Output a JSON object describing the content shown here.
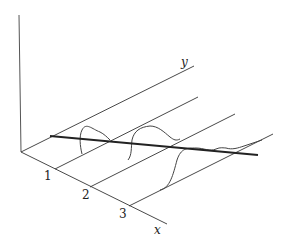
{
  "diagram": {
    "axes": {
      "x_label": "x",
      "y_label": "y",
      "tick_labels": [
        "1",
        "2",
        "3"
      ]
    },
    "elements": [
      "vertical axis",
      "y axis (receding diagonal)",
      "x axis (diagonal down-right) with ticks 1, 2, 3",
      "three parallel lines from ticks 1, 2, 3 parallel to y axis",
      "wavy curves drawn on each parallel line",
      "thick straight line crossing the parallel lines"
    ]
  }
}
